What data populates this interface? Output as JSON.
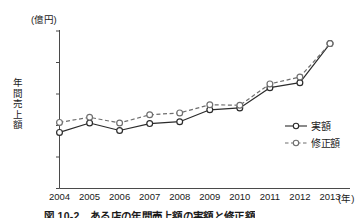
{
  "figure": {
    "unit_top": "(億円)",
    "y_axis_label": "年間売上額",
    "x_axis_unit": "(年)",
    "caption": "図 10-2　ある店の年間売上額の実額と修正額"
  },
  "legend": {
    "items": [
      {
        "label": "実額",
        "style": "solid",
        "marker": "open-circle",
        "color": "#2b2b2b"
      },
      {
        "label": "修正額",
        "style": "dashed",
        "marker": "open-circle",
        "color": "#6e6e6e"
      }
    ]
  },
  "chart_data": {
    "type": "line",
    "title": "図 10-2　ある店の年間売上額の実額と修正額",
    "xlabel": "(年)",
    "ylabel": "年間売上額",
    "unit": "億円",
    "x": [
      2004,
      2005,
      2006,
      2007,
      2008,
      2009,
      2010,
      2011,
      2012,
      2013
    ],
    "xtick_labels": [
      "2004",
      "2005",
      "2006",
      "2007",
      "2008",
      "2009",
      "2010",
      "2011",
      "2012",
      "2013"
    ],
    "ytick_labels": [
      "0",
      "500",
      "1000",
      "1500",
      "2000",
      "2500"
    ],
    "yticks": [
      0,
      500,
      1000,
      1500,
      2000,
      2500
    ],
    "ylim": [
      0,
      2500
    ],
    "grid": false,
    "legend_position": "right-middle",
    "series": [
      {
        "name": "実額",
        "style": "solid",
        "values": [
          890,
          1040,
          920,
          1030,
          1060,
          1250,
          1280,
          1600,
          1680,
          2300
        ]
      },
      {
        "name": "修正額",
        "style": "dashed",
        "values": [
          1050,
          1130,
          1040,
          1170,
          1200,
          1330,
          1320,
          1660,
          1770,
          2300
        ]
      }
    ]
  }
}
